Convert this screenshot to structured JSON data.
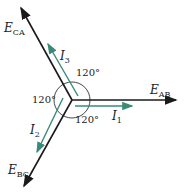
{
  "voltages": [
    {
      "name": "E",
      "sub": "AB",
      "angle_deg": 0
    },
    {
      "name": "E",
      "sub": "CA",
      "angle_deg": 120
    },
    {
      "name": "E",
      "sub": "BC",
      "angle_deg": 240
    }
  ],
  "currents": [
    {
      "name": "I",
      "sub": "1",
      "phase": "AB"
    },
    {
      "name": "I",
      "sub": "2",
      "phase": "BC"
    },
    {
      "name": "I",
      "sub": "3",
      "phase": "CA"
    }
  ],
  "angles": {
    "top": "120°",
    "left": "120°",
    "bottom": "120°"
  },
  "colors": {
    "voltage": "#1a1a1a",
    "current": "#3a8a78"
  }
}
